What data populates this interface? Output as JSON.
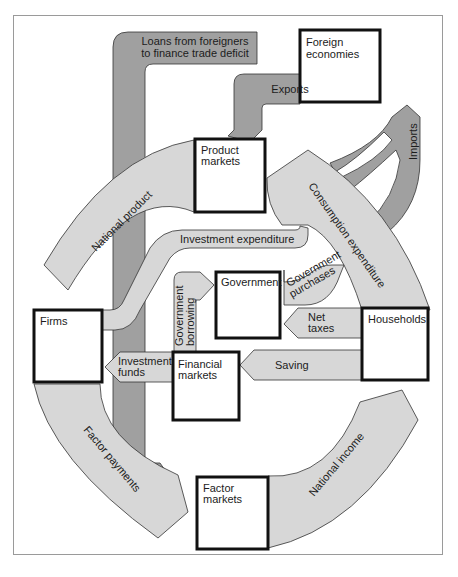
{
  "diagram": {
    "colors": {
      "light_flow": "#d7d7d7",
      "dark_flow": "#a0a0a0",
      "box_border": "#111111",
      "frame": "#9a9a9a"
    },
    "nodes": {
      "foreign": {
        "line1": "Foreign",
        "line2": "economies"
      },
      "product": {
        "line1": "Product",
        "line2": "markets"
      },
      "government": {
        "line1": "Government"
      },
      "households": {
        "line1": "Households"
      },
      "firms": {
        "line1": "Firms"
      },
      "financial": {
        "line1": "Financial",
        "line2": "markets"
      },
      "factor": {
        "line1": "Factor",
        "line2": "markets"
      }
    },
    "flows": {
      "loans": {
        "line1": "Loans from foreigners",
        "line2": "to finance trade deficit"
      },
      "exports": {
        "line1": "Exports"
      },
      "imports": {
        "line1": "Imports"
      },
      "national_product": {
        "line1": "National product"
      },
      "consumption": {
        "line1": "Consumption expenditure"
      },
      "investment_expenditure": {
        "line1": "Investment expenditure"
      },
      "gov_purchases": {
        "line1": "Government",
        "line2": "purchases"
      },
      "gov_borrowing": {
        "line1": "Government",
        "line2": "borrowing"
      },
      "net_taxes": {
        "line1": "Net",
        "line2": "taxes"
      },
      "saving": {
        "line1": "Saving"
      },
      "investment_funds": {
        "line1": "Investment",
        "line2": "funds"
      },
      "factor_payments": {
        "line1": "Factor payments"
      },
      "national_income": {
        "line1": "National income"
      }
    }
  }
}
